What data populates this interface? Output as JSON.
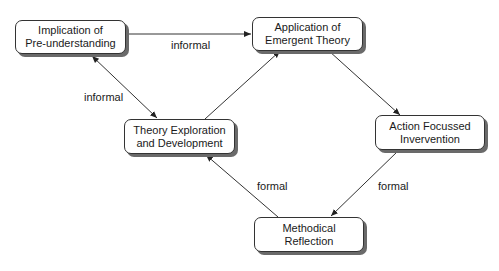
{
  "diagram": {
    "nodes": [
      {
        "id": "implication",
        "lines": [
          "Implication of",
          "Pre-understanding"
        ]
      },
      {
        "id": "application",
        "lines": [
          "Application of",
          "Emergent Theory"
        ]
      },
      {
        "id": "theory",
        "lines": [
          "Theory Exploration",
          "and Development"
        ]
      },
      {
        "id": "action",
        "lines": [
          "Action Focussed",
          "Invervention"
        ]
      },
      {
        "id": "reflection",
        "lines": [
          "Methodical",
          "Reflection"
        ]
      }
    ],
    "edges": [
      {
        "from": "implication",
        "to": "application",
        "label": "informal",
        "direction": "forward"
      },
      {
        "from": "implication",
        "to": "theory",
        "label": "informal",
        "direction": "both"
      },
      {
        "from": "theory",
        "to": "application",
        "label": "",
        "direction": "forward"
      },
      {
        "from": "application",
        "to": "action",
        "label": "",
        "direction": "forward"
      },
      {
        "from": "action",
        "to": "reflection",
        "label": "formal",
        "direction": "forward"
      },
      {
        "from": "reflection",
        "to": "theory",
        "label": "formal",
        "direction": "forward"
      }
    ],
    "colors": {
      "line": "#333333",
      "shadow": "#6a6a6a",
      "text": "#1a1a1a"
    }
  }
}
